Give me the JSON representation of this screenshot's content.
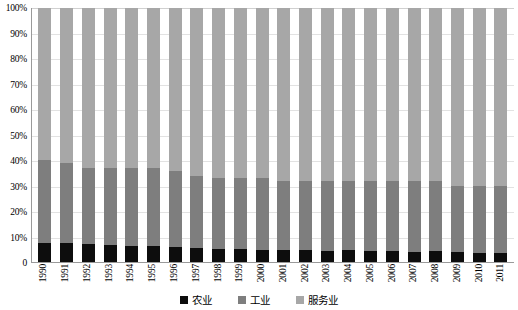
{
  "chart_data": {
    "type": "bar",
    "subtype": "stacked-100-percent",
    "title": "",
    "xlabel": "",
    "ylabel": "",
    "ylim": [
      0,
      100
    ],
    "yticks": [
      "0",
      "10%",
      "20%",
      "30%",
      "40%",
      "50%",
      "60%",
      "70%",
      "80%",
      "90%",
      "100%"
    ],
    "ytick_values": [
      0,
      10,
      20,
      30,
      40,
      50,
      60,
      70,
      80,
      90,
      100
    ],
    "grid": true,
    "legend_position": "bottom",
    "categories": [
      "1990",
      "1991",
      "1992",
      "1993",
      "1994",
      "1995",
      "1996",
      "1997",
      "1998",
      "1999",
      "2000",
      "2001",
      "2002",
      "2003",
      "2004",
      "2005",
      "2006",
      "2007",
      "2008",
      "2009",
      "2010",
      "2011"
    ],
    "series": [
      {
        "name": "农业",
        "color": "#0d0d0d",
        "values": [
          7.4,
          7.6,
          7.0,
          6.7,
          6.4,
          6.2,
          6.0,
          5.6,
          5.3,
          5.0,
          4.9,
          4.8,
          4.7,
          4.5,
          4.6,
          4.4,
          4.2,
          4.0,
          4.2,
          3.8,
          3.6,
          3.5
        ]
      },
      {
        "name": "工业",
        "color": "#7e7e7e",
        "values": [
          32.6,
          31.4,
          30.0,
          30.3,
          30.6,
          30.8,
          30.0,
          28.4,
          27.7,
          28.0,
          28.1,
          27.2,
          27.3,
          27.5,
          27.4,
          27.6,
          27.8,
          28.0,
          27.8,
          26.2,
          26.4,
          26.5
        ]
      },
      {
        "name": "服务业",
        "color": "#a7a7a7",
        "values": [
          60.0,
          61.0,
          63.0,
          63.0,
          63.0,
          63.0,
          64.0,
          66.0,
          67.0,
          67.0,
          67.0,
          68.0,
          68.0,
          68.0,
          68.0,
          68.0,
          68.0,
          68.0,
          68.0,
          70.0,
          70.0,
          70.0
        ]
      }
    ],
    "legend": [
      {
        "label": "农业",
        "color": "#0d0d0d"
      },
      {
        "label": "工业",
        "color": "#7e7e7e"
      },
      {
        "label": "服务业",
        "color": "#a7a7a7"
      }
    ]
  }
}
